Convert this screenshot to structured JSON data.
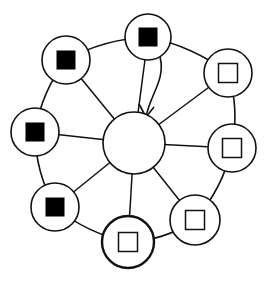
{
  "diagram": {
    "type": "ring-network",
    "colors": {
      "stroke": "#111111",
      "fill": "#ffffff",
      "filled_square": "#000000"
    },
    "hub": {
      "id": "hub",
      "cx": 134,
      "cy": 143,
      "r": 31
    },
    "ring": {
      "description": "outer ring connecting adjacent peripheral nodes"
    },
    "nodes": [
      {
        "id": "n1",
        "cx": 148,
        "cy": 37,
        "r": 23,
        "square": "filled",
        "emphasis": false
      },
      {
        "id": "n2",
        "cx": 228,
        "cy": 73,
        "r": 24,
        "square": "empty",
        "emphasis": false
      },
      {
        "id": "n3",
        "cx": 232,
        "cy": 148,
        "r": 24,
        "square": "empty",
        "emphasis": false
      },
      {
        "id": "n4",
        "cx": 195,
        "cy": 220,
        "r": 25,
        "square": "empty",
        "emphasis": false
      },
      {
        "id": "n5",
        "cx": 128,
        "cy": 242,
        "r": 26,
        "square": "empty",
        "emphasis": true
      },
      {
        "id": "n6",
        "cx": 55,
        "cy": 207,
        "r": 24,
        "square": "filled",
        "emphasis": false
      },
      {
        "id": "n7",
        "cx": 35,
        "cy": 132,
        "r": 24,
        "square": "filled",
        "emphasis": false
      },
      {
        "id": "n8",
        "cx": 66,
        "cy": 60,
        "r": 24,
        "square": "filled",
        "emphasis": false
      }
    ],
    "arrow": {
      "from": "n1",
      "to": "hub",
      "style": "curved"
    }
  }
}
